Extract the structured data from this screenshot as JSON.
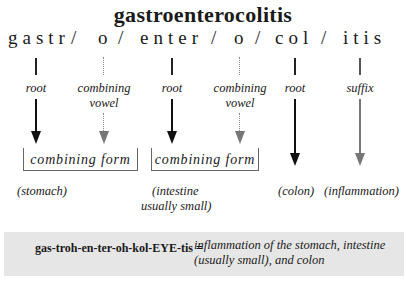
{
  "title": "gastroenterocolitis",
  "parts": [
    {
      "text": "gastr",
      "type": "root",
      "meaning": "(stomach)"
    },
    {
      "text": "o",
      "type": "combining vowel"
    },
    {
      "text": "enter",
      "type": "root",
      "meaning": "(intestine usually small)"
    },
    {
      "text": "o",
      "type": "combining vowel"
    },
    {
      "text": "col",
      "type": "root",
      "meaning": "(colon)"
    },
    {
      "text": "itis",
      "type": "suffix",
      "meaning": "(inflammation)"
    }
  ],
  "separator": "/",
  "labels": {
    "root": "root",
    "combining_line1": "combining",
    "combining_line2": "vowel",
    "suffix": "suffix"
  },
  "combining_form_label": "combining form",
  "meanings": {
    "stomach": "(stomach)",
    "intestine_line1": "(intestine",
    "intestine_line2": "usually small)",
    "colon": "(colon)",
    "inflammation": "(inflammation)"
  },
  "pronunciation": {
    "word": "gas-troh-en-ter-oh-kol-EYE-tis =",
    "definition_line1": "inflammation of the stomach, intestine",
    "definition_line2": "(usually small), and colon"
  },
  "colors": {
    "primary_arrow": "#111111",
    "secondary_arrow": "#777777",
    "pronunciation_bg": "#e6e6e6"
  }
}
